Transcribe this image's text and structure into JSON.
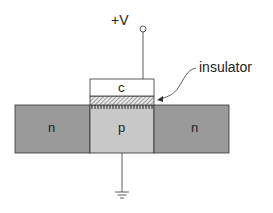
{
  "diagram": {
    "labels": {
      "voltage": "+V",
      "gate": "c",
      "insulator": "insulator",
      "source": "n",
      "body": "p",
      "drain": "n"
    },
    "colors": {
      "n_region": "#9a9a9a",
      "p_region": "#c8c8c8",
      "gate": "#ffffff",
      "outline": "#333333",
      "background": "#ffffff"
    }
  }
}
